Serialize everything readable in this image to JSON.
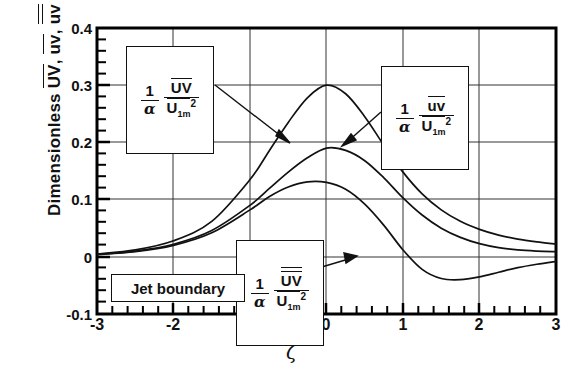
{
  "chart_data": {
    "type": "line",
    "title": "",
    "xlabel": "ζ",
    "ylabel": "Dimensionless UV, uv, üv",
    "xlim": [
      -3,
      3
    ],
    "ylim": [
      -0.1,
      0.4
    ],
    "xticks": [
      "-3",
      "-2",
      "-1",
      "0",
      "1",
      "2",
      "3"
    ],
    "xtick_values": [
      -3,
      -2,
      -1,
      0,
      1,
      2,
      3
    ],
    "yticks": [
      "-0.1",
      "0",
      "0.1",
      "0.2",
      "0.3",
      "0.4"
    ],
    "ytick_values": [
      -0.1,
      0,
      0.1,
      0.2,
      0.3,
      0.4
    ],
    "grid": true,
    "legend": "none",
    "minor_ticks": true,
    "series": [
      {
        "name": "UV",
        "label_ref": "callout_uv_upper",
        "x": [
          -3,
          -2.5,
          -2,
          -1.5,
          -1,
          -0.75,
          -0.5,
          -0.25,
          0,
          0.25,
          0.5,
          0.75,
          1,
          1.25,
          1.5,
          1.75,
          2,
          2.25,
          2.5,
          2.75,
          3
        ],
        "y": [
          0.005,
          0.012,
          0.028,
          0.062,
          0.135,
          0.185,
          0.235,
          0.278,
          0.3,
          0.285,
          0.245,
          0.195,
          0.148,
          0.11,
          0.082,
          0.062,
          0.048,
          0.038,
          0.031,
          0.026,
          0.022
        ]
      },
      {
        "name": "uv",
        "label_ref": "callout_uv_lower",
        "x": [
          -3,
          -2.5,
          -2,
          -1.5,
          -1,
          -0.75,
          -0.5,
          -0.25,
          0,
          0.25,
          0.5,
          0.75,
          1,
          1.25,
          1.5,
          1.75,
          2,
          2.25,
          2.5,
          2.75,
          3
        ],
        "y": [
          0.004,
          0.01,
          0.022,
          0.046,
          0.09,
          0.119,
          0.148,
          0.173,
          0.19,
          0.186,
          0.168,
          0.138,
          0.103,
          0.073,
          0.05,
          0.034,
          0.023,
          0.016,
          0.012,
          0.01,
          0.009
        ]
      },
      {
        "name": "üv",
        "label_ref": "callout_uv_dots",
        "x": [
          -3,
          -2.5,
          -2,
          -1.5,
          -1,
          -0.75,
          -0.5,
          -0.25,
          0,
          0.25,
          0.5,
          0.75,
          1,
          1.25,
          1.5,
          1.75,
          2,
          2.25,
          2.5,
          2.75,
          3
        ],
        "y": [
          0.004,
          0.009,
          0.02,
          0.042,
          0.082,
          0.105,
          0.122,
          0.131,
          0.13,
          0.118,
          0.092,
          0.055,
          0.012,
          -0.022,
          -0.038,
          -0.04,
          -0.035,
          -0.027,
          -0.019,
          -0.013,
          -0.008
        ]
      }
    ],
    "annotations": [
      {
        "id": "callout_uv_upper",
        "text_parts": {
          "one": "1",
          "alpha": "α",
          "numerator": "UV",
          "denominator": "U",
          "den_sub": "1m",
          "den_sup": "2"
        },
        "overbars": "numerator_single_denominator_single",
        "arrow_to": {
          "x": -0.6,
          "y": 0.205
        }
      },
      {
        "id": "callout_uv_lower",
        "text_parts": {
          "one": "1",
          "alpha": "α",
          "numerator": "uv",
          "denominator": "U",
          "den_sub": "1m",
          "den_sup": "2"
        },
        "overbars": "numerator_single_denominator_single",
        "arrow_to": {
          "x": 0.18,
          "y": 0.196
        }
      },
      {
        "id": "callout_uv_dots",
        "text_parts": {
          "one": "1",
          "alpha": "α",
          "numerator": "UV",
          "denominator": "U",
          "den_sub": "1m",
          "den_sup": "2"
        },
        "overbars": "numerator_double_denominator_single",
        "arrow_to": {
          "x": 0.62,
          "y": -0.006
        }
      },
      {
        "id": "jet_boundary",
        "text": "Jet boundary"
      }
    ]
  },
  "labels": {
    "jet_boundary": "Jet boundary",
    "y_axis_prefix": "Dimensionless",
    "y_axis_terms": [
      "UV",
      "uv",
      "üv"
    ],
    "x_axis": "ζ",
    "one": "1",
    "alpha": "α",
    "u_base": "U",
    "sub_1m": "1m",
    "sup_2": "2",
    "num_UV": "UV",
    "num_uv": "uv",
    "num_UV_dots": "UV"
  },
  "colors": {
    "line": "#111111",
    "grid": "#333333",
    "axis": "#000000",
    "background": "#ffffff"
  }
}
